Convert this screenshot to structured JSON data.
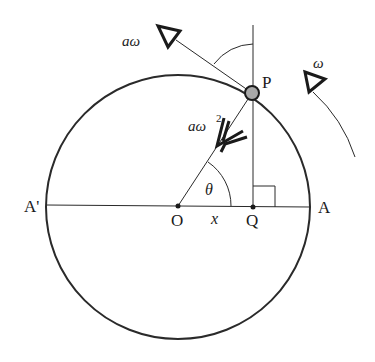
{
  "diagram": {
    "type": "circular-motion / SHM projection",
    "labels": {
      "point_on_circle": "P",
      "center": "O",
      "foot": "Q",
      "right_end": "A",
      "left_end": "A'",
      "displacement": "x",
      "angle_at_center": "θ",
      "angle_at_P": "θ",
      "tangential_velocity": "aω",
      "centripetal_accel_base": "aω",
      "centripetal_accel_exp": "2",
      "angular_velocity": "ω"
    },
    "colors": {
      "line": "#2a2a2a",
      "particle_fill": "#a8a8a8",
      "background": "#ffffff"
    }
  }
}
